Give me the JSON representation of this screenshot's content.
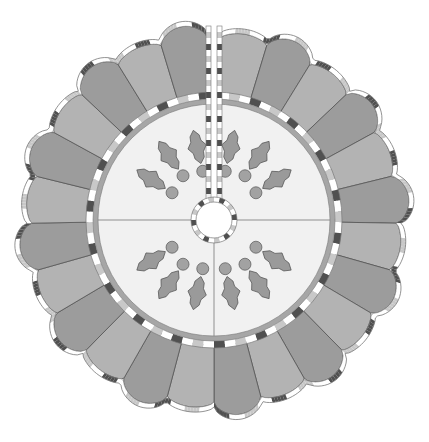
{
  "diagram": {
    "center": [
      214,
      220
    ],
    "radii": {
      "hole": 18,
      "hole_binding": 23,
      "center_panel": 116,
      "inner_ring": 121,
      "inner_binding": 128,
      "petal_base": 128,
      "petal_tip": 196,
      "scallop_bulge": 14
    },
    "slit": {
      "angle_deg": -90,
      "gap_px": 6
    },
    "wedges": {
      "count": 24,
      "start_deg": -88,
      "sweep_deg": 356,
      "pattern": [
        "light",
        "dark"
      ]
    },
    "quadrant_lines": true,
    "holly_clusters": [
      {
        "angle_deg": -125
      },
      {
        "angle_deg": -55
      },
      {
        "angle_deg": 125
      },
      {
        "angle_deg": 55
      }
    ],
    "colors": {
      "background": "#ffffff",
      "wedge_dark": "#9c9c9c",
      "wedge_light": "#b3b3b3",
      "wedge_stroke": "#555555",
      "center_panel": "#f1f1f1",
      "inner_ring": "#a6a6a6",
      "binding_light": "#ffffff",
      "binding_mid": "#c8c8c8",
      "binding_dark": "#505050",
      "binding_stroke": "#777777",
      "holly_leaf": "#9a9a9a",
      "holly_berry": "#a2a2a2",
      "holly_stroke": "#555555",
      "hole": "#ffffff"
    }
  }
}
